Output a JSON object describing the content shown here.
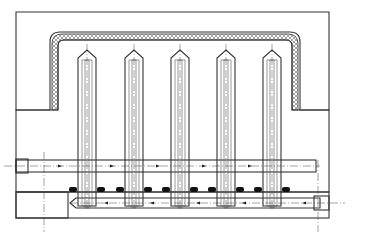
{
  "figure": {
    "type": "engineering cross-section drawing",
    "pin_count": 5,
    "pin_centers_x": [
      87,
      134,
      180,
      226,
      272
    ],
    "bounding_box": {
      "x": 16,
      "y": 12,
      "width": 313,
      "height": 206
    },
    "colors": {
      "line": "#333333",
      "background": "#ffffff",
      "seal": "#111111"
    },
    "labels": []
  }
}
